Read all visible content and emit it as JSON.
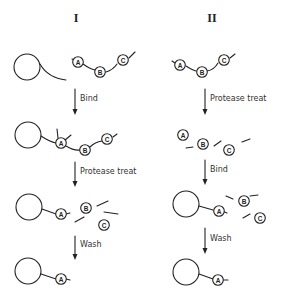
{
  "columns": [
    {
      "title": "I",
      "steps": [
        "Bind",
        "Protease treat",
        "Wash"
      ]
    },
    {
      "title": "II",
      "steps": [
        "Protease treat",
        "Bind",
        "Wash"
      ]
    }
  ],
  "domains": [
    "A",
    "B",
    "C"
  ]
}
